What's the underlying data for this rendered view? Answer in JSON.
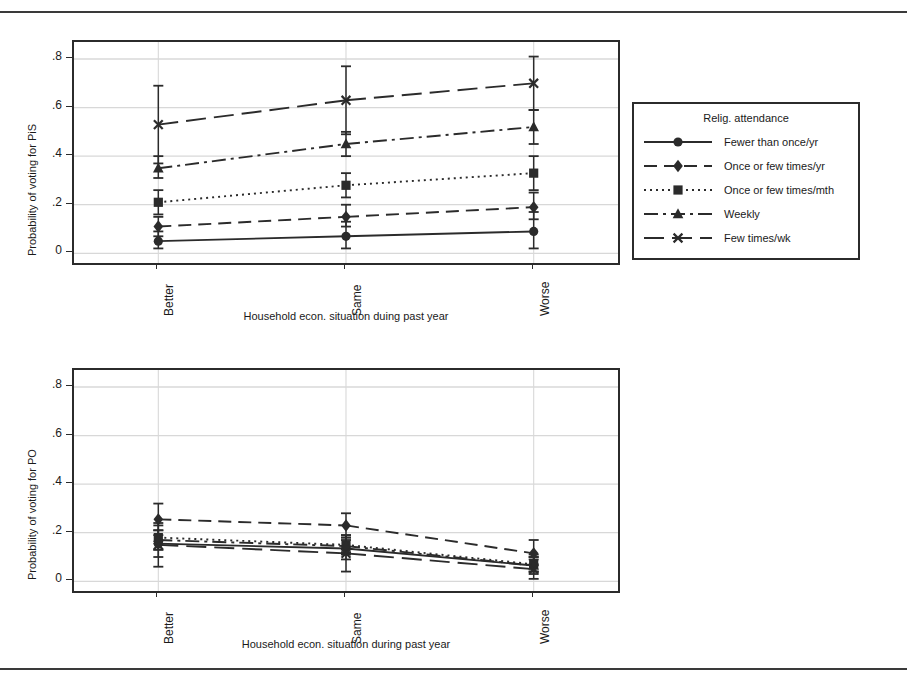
{
  "figure": {
    "background": "#ffffff",
    "ink": "#2b2b2b",
    "gridline_color": "#d8d8d8"
  },
  "legend": {
    "title": "Relig. attendance",
    "items": [
      {
        "label": "Fewer than once/yr",
        "marker": "circle",
        "dash": "solid"
      },
      {
        "label": "Once or few times/yr",
        "marker": "diamond",
        "dash": "longdash"
      },
      {
        "label": "Once or few times/mth",
        "marker": "square",
        "dash": "dotted"
      },
      {
        "label": "Weekly",
        "marker": "triangle",
        "dash": "dashdot"
      },
      {
        "label": "Few times/wk",
        "marker": "cross",
        "dash": "longdash2"
      }
    ]
  },
  "panels": [
    {
      "id": "pis",
      "ylabel": "Probability of voting for PiS",
      "xlabel": "Household econ. situation duing past year"
    },
    {
      "id": "po",
      "ylabel": "Probability of voting for PO",
      "xlabel": "Household econ. situation during past year"
    }
  ],
  "chart_data": [
    {
      "type": "line",
      "title": "",
      "xlabel": "Household econ. situation duing past year",
      "ylabel": "Probability of voting for PiS",
      "categories": [
        "Better",
        "Same",
        "Worse"
      ],
      "yticks": [
        0,
        0.2,
        0.4,
        0.6,
        0.8
      ],
      "ytick_labels": [
        "0",
        ".2",
        ".4",
        ".6",
        ".8"
      ],
      "ylim": [
        -0.04,
        0.87
      ],
      "grid": "horizontal",
      "legend_position": "right-outside",
      "error_bars": "95% confidence interval",
      "series": [
        {
          "name": "Fewer than once/yr",
          "marker": "circle",
          "dash": "solid",
          "values": [
            0.05,
            0.07,
            0.09
          ],
          "ci_low": [
            0.02,
            0.02,
            0.02
          ],
          "ci_high": [
            0.09,
            0.13,
            0.17
          ]
        },
        {
          "name": "Once or few times/yr",
          "marker": "diamond",
          "dash": "longdash",
          "values": [
            0.11,
            0.15,
            0.19
          ],
          "ci_low": [
            0.07,
            0.11,
            0.14
          ],
          "ci_high": [
            0.15,
            0.2,
            0.25
          ]
        },
        {
          "name": "Once or few times/mth",
          "marker": "square",
          "dash": "dotted",
          "values": [
            0.21,
            0.28,
            0.33
          ],
          "ci_low": [
            0.16,
            0.23,
            0.26
          ],
          "ci_high": [
            0.26,
            0.33,
            0.4
          ]
        },
        {
          "name": "Weekly",
          "marker": "triangle",
          "dash": "dashdot",
          "values": [
            0.35,
            0.45,
            0.52
          ],
          "ci_low": [
            0.31,
            0.4,
            0.45
          ],
          "ci_high": [
            0.4,
            0.5,
            0.59
          ]
        },
        {
          "name": "Few times/wk",
          "marker": "cross",
          "dash": "longdash2",
          "values": [
            0.53,
            0.63,
            0.7
          ],
          "ci_low": [
            0.37,
            0.49,
            0.59
          ],
          "ci_high": [
            0.69,
            0.77,
            0.81
          ]
        }
      ]
    },
    {
      "type": "line",
      "title": "",
      "xlabel": "Household econ. situation during past year",
      "ylabel": "Probability of voting for PO",
      "categories": [
        "Better",
        "Same",
        "Worse"
      ],
      "yticks": [
        0,
        0.2,
        0.4,
        0.6,
        0.8
      ],
      "ytick_labels": [
        "0",
        ".2",
        ".4",
        ".6",
        ".8"
      ],
      "ylim": [
        -0.04,
        0.87
      ],
      "grid": "horizontal",
      "legend_position": "right-outside",
      "error_bars": "95% confidence interval",
      "series": [
        {
          "name": "Fewer than once/yr",
          "marker": "circle",
          "dash": "solid",
          "values": [
            0.155,
            0.135,
            0.065
          ],
          "ci_low": [
            0.1,
            0.09,
            0.03
          ],
          "ci_high": [
            0.21,
            0.18,
            0.1
          ]
        },
        {
          "name": "Once or few times/yr",
          "marker": "diamond",
          "dash": "longdash",
          "values": [
            0.255,
            0.23,
            0.115
          ],
          "ci_low": [
            0.19,
            0.18,
            0.07
          ],
          "ci_high": [
            0.32,
            0.28,
            0.17
          ]
        },
        {
          "name": "Once or few times/mth",
          "marker": "square",
          "dash": "dotted",
          "values": [
            0.18,
            0.15,
            0.07
          ],
          "ci_low": [
            0.13,
            0.11,
            0.04
          ],
          "ci_high": [
            0.23,
            0.19,
            0.11
          ]
        },
        {
          "name": "Weekly",
          "marker": "triangle",
          "dash": "dashdot",
          "values": [
            0.17,
            0.145,
            0.065
          ],
          "ci_low": [
            0.13,
            0.12,
            0.04
          ],
          "ci_high": [
            0.21,
            0.17,
            0.09
          ]
        },
        {
          "name": "Few times/wk",
          "marker": "cross",
          "dash": "longdash2",
          "values": [
            0.15,
            0.115,
            0.05
          ],
          "ci_low": [
            0.06,
            0.04,
            0.01
          ],
          "ci_high": [
            0.24,
            0.19,
            0.1
          ]
        }
      ]
    }
  ]
}
